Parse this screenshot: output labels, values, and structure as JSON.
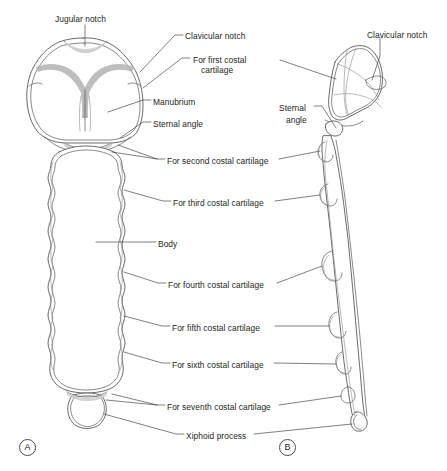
{
  "figure": {
    "background_color": "#ffffff",
    "ink_color": "#231f20",
    "shade_color": "#b3b3b3",
    "outline_color": "#595959"
  },
  "panels": [
    {
      "letter": "A",
      "name": "anterior-view",
      "x": 19,
      "y": 439
    },
    {
      "letter": "B",
      "name": "lateral-view",
      "x": 279,
      "y": 439
    }
  ],
  "labels": [
    {
      "id": "jugular-notch",
      "text": "Jugular notch",
      "x": 55,
      "y": 14,
      "align": "left"
    },
    {
      "id": "clavicular-notch-a",
      "text": "Clavicular notch",
      "x": 185,
      "y": 31,
      "align": "left"
    },
    {
      "id": "for-first-costal-l1",
      "text": "For first costal",
      "x": 193,
      "y": 55,
      "align": "left"
    },
    {
      "id": "for-first-costal-l2",
      "text": "cartilage",
      "x": 201,
      "y": 65,
      "align": "left"
    },
    {
      "id": "manubrium",
      "text": "Manubrium",
      "x": 153,
      "y": 97,
      "align": "left"
    },
    {
      "id": "sternal-angle-a",
      "text": "Sternal angle",
      "x": 153,
      "y": 119,
      "align": "left"
    },
    {
      "id": "for-second-costal",
      "text": "For second costal cartilage",
      "x": 167,
      "y": 156,
      "align": "left"
    },
    {
      "id": "for-third-costal",
      "text": "For third costal cartilage",
      "x": 173,
      "y": 198,
      "align": "left"
    },
    {
      "id": "body",
      "text": "Body",
      "x": 158,
      "y": 239,
      "align": "left"
    },
    {
      "id": "for-fourth-costal",
      "text": "For fourth costal cartilage",
      "x": 168,
      "y": 280,
      "align": "left"
    },
    {
      "id": "for-fifth-costal",
      "text": "For fifth costal cartilage",
      "x": 172,
      "y": 323,
      "align": "left"
    },
    {
      "id": "for-sixth-costal",
      "text": "For sixth costal cartilage",
      "x": 172,
      "y": 360,
      "align": "left"
    },
    {
      "id": "for-seventh-costal",
      "text": "For seventh costal cartilage",
      "x": 167,
      "y": 402,
      "align": "left"
    },
    {
      "id": "xiphoid-process",
      "text": "Xiphoid process",
      "x": 186,
      "y": 431,
      "align": "left"
    },
    {
      "id": "clavicular-notch-b",
      "text": "Clavicular notch",
      "x": 367,
      "y": 30,
      "align": "left"
    },
    {
      "id": "sternal-angle-b-l1",
      "text": "Sternal",
      "x": 279,
      "y": 103,
      "align": "left"
    },
    {
      "id": "sternal-angle-b-l2",
      "text": "angle",
      "x": 286,
      "y": 115,
      "align": "left"
    }
  ],
  "caption": {
    "text": ""
  }
}
